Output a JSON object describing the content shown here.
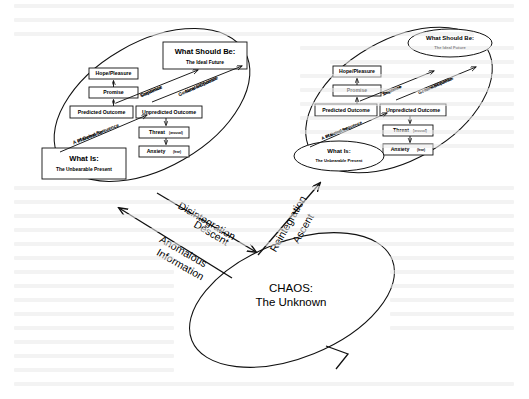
{
  "figure": {
    "chaos_label_line1": "CHAOS:",
    "chaos_label_line2": "The Unknown"
  },
  "flow_labels": {
    "disintegration": "Disintegration",
    "descent": "Descent",
    "anomalous": "Anomalous",
    "information": "Information",
    "reintegration": "Reintegration",
    "ascent": "Ascent"
  },
  "left_frame": {
    "ideal_title": "What Should Be:",
    "ideal_sub": "The Ideal Future",
    "present_title": "What Is:",
    "present_sub": "The Unbearable Present",
    "nodes": {
      "hope": "Hope/Pleasure",
      "promise": "Promise",
      "predicted": "Predicted Outcome",
      "unpredicted": "Unpredicted Outcome",
      "threat": "Threat",
      "threat_paren": "(arousal)",
      "anxiety": "Anxiety",
      "anxiety_paren": "(fear)"
    },
    "arc_labels": {
      "continue1": "Continue",
      "continue2": "Sequence",
      "generate1": "Generate/Choose",
      "generate2": "New Sequence",
      "plan1": "A Planned Sequence",
      "plan2": "of Behavior"
    }
  },
  "right_frame": {
    "ideal_title": "What Should Be:",
    "ideal_sub": "The Ideal Future",
    "present_title": "What Is:",
    "present_sub": "The Unbearable Present",
    "nodes": {
      "hope": "Hope/Pleasure",
      "promise": "Promise",
      "predicted": "Predicted Outcome",
      "unpredicted": "Unpredicted Outcome",
      "threat": "Threat",
      "threat_paren": "(arousal)",
      "anxiety": "Anxiety",
      "anxiety_paren": "(fear)"
    },
    "arc_labels": {
      "continue1": "Continue",
      "continue2": "Sequence",
      "generate1": "Generate/Choose",
      "generate2": "New Sequence",
      "plan1": "A Planned Sequence",
      "plan2": "of Behavior"
    }
  },
  "colors": {
    "ink": "#111111",
    "paper": "#ffffff"
  }
}
